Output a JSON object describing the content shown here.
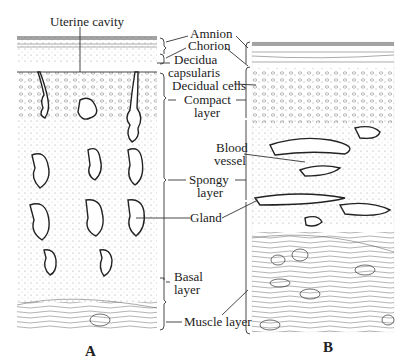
{
  "figure": {
    "panels": [
      {
        "id": "A",
        "label": "A"
      },
      {
        "id": "B",
        "label": "B"
      }
    ],
    "labels": {
      "uterine_cavity": "Uterine cavity",
      "amnion": "Amnion",
      "chorion": "Chorion",
      "decidua_1": "Decidua",
      "decidua_2": "capsularis",
      "decidual_cells": "Decidual cells",
      "compact_1": "Compact",
      "compact_2": "layer",
      "blood_1": "Blood",
      "blood_2": "vessel",
      "spongy_1": "Spongy",
      "spongy_2": "layer",
      "gland": "Gland",
      "basal_1": "Basal",
      "basal_2": "layer",
      "muscle_layer": "Muscle layer"
    },
    "colors": {
      "ink": "#222222",
      "background": "#ffffff",
      "stipple": "#888888"
    }
  }
}
